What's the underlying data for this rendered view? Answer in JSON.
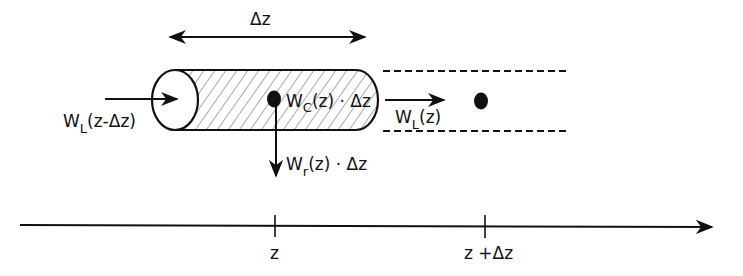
{
  "diagram": {
    "type": "mass-balance-control-volume",
    "colors": {
      "stroke": "#111111",
      "background": "#ffffff",
      "hatch": "#555555"
    },
    "delta_label": "Δz",
    "inflow_label": {
      "main": "W",
      "sub": "L",
      "rest": "(z-Δz)"
    },
    "convection_label": {
      "main": "W",
      "sub": "C",
      "rest": "(z) · Δz"
    },
    "outflow_label": {
      "main": "W",
      "sub": "L",
      "rest": "(z)"
    },
    "reaction_label": {
      "main": "W",
      "sub": "r",
      "rest": "(z) · Δz"
    },
    "axis": {
      "ticks": [
        {
          "label": "z"
        },
        {
          "label": "z +Δz"
        }
      ]
    }
  }
}
